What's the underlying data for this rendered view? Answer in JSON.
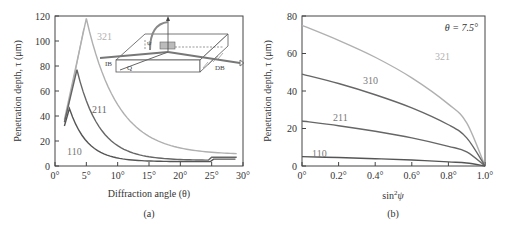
{
  "chart_data": [
    {
      "type": "line",
      "panel": "(a)",
      "xlabel": "Diffraction angle (θ)",
      "ylabel": "Penetration depth, τ (μm)",
      "xlim": [
        0,
        30
      ],
      "ylim": [
        0,
        120
      ],
      "xticks": [
        "0°",
        "5°",
        "10°",
        "15°",
        "20°",
        "25°",
        "30°"
      ],
      "yticks": [
        "0",
        "20",
        "40",
        "60",
        "80",
        "100",
        "120"
      ],
      "inset": {
        "labels": [
          "IB",
          "DB",
          "Q",
          "ψ"
        ],
        "description": "Schematic of incident beam (IB) and diffracted beam (DB) on a specimen block"
      },
      "series": [
        {
          "name": "321",
          "color": "#b0b0b0",
          "x": [
            1.5,
            5,
            7.5,
            10,
            15,
            20,
            25,
            29
          ],
          "y": [
            37,
            118,
            62,
            40,
            20,
            13,
            10,
            9
          ]
        },
        {
          "name": "211",
          "color": "#666666",
          "x": [
            1.5,
            3.5,
            5,
            7.5,
            10,
            15,
            20,
            25,
            25,
            29
          ],
          "y": [
            35,
            77,
            55,
            30,
            18,
            10,
            7,
            5,
            7,
            7
          ]
        },
        {
          "name": "110",
          "color": "#555555",
          "x": [
            1.5,
            2.3,
            3,
            5,
            7.5,
            10,
            15,
            20,
            25,
            29
          ],
          "y": [
            32,
            46,
            33,
            17,
            10,
            7,
            5,
            4,
            4,
            5
          ]
        }
      ]
    },
    {
      "type": "line",
      "panel": "(b)",
      "xlabel": "sin²ψ",
      "ylabel": "Penetration depth, τ (μm)",
      "xlim": [
        0,
        1.0
      ],
      "ylim": [
        0,
        80
      ],
      "xticks": [
        "0°",
        "0.2°",
        "0.4°",
        "0.6°",
        "0.8°",
        "1.0°"
      ],
      "yticks": [
        "0",
        "20",
        "40",
        "60",
        "80"
      ],
      "annotation": "θ = 7.5°",
      "series": [
        {
          "name": "321",
          "color": "#b0b0b0",
          "x": [
            0,
            0.2,
            0.4,
            0.6,
            0.8,
            0.9,
            1.0
          ],
          "y": [
            75,
            67,
            58,
            47,
            33,
            23,
            0
          ]
        },
        {
          "name": "310",
          "color": "#666666",
          "x": [
            0,
            0.2,
            0.4,
            0.6,
            0.8,
            0.9,
            1.0
          ],
          "y": [
            49,
            44,
            38,
            31,
            22,
            15,
            0
          ]
        },
        {
          "name": "211",
          "color": "#666666",
          "x": [
            0,
            0.2,
            0.4,
            0.6,
            0.8,
            0.9,
            1.0
          ],
          "y": [
            24,
            21.5,
            18.5,
            15,
            10.5,
            7.5,
            0
          ]
        },
        {
          "name": "110",
          "color": "#555555",
          "x": [
            0,
            0.2,
            0.4,
            0.6,
            0.8,
            0.9,
            1.0
          ],
          "y": [
            5,
            4.5,
            3.9,
            3.2,
            2.2,
            1.6,
            0
          ]
        }
      ]
    }
  ],
  "labels": {
    "a_ylabel": "Penetration depth, τ (μm)",
    "a_xlabel": "Diffraction angle (θ)",
    "a_caption": "(a)",
    "b_ylabel": "Penetration depth, τ (μm)",
    "b_xlabel_base": "sin",
    "b_xlabel_sup": "2",
    "b_xlabel_var": "ψ",
    "b_caption": "(b)",
    "b_annotation": "θ = 7.5°",
    "inset_ib": "IB",
    "inset_db": "DB",
    "inset_q": "Q",
    "inset_psi": "ψ"
  }
}
